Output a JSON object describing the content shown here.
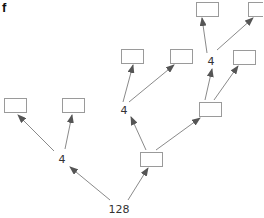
{
  "panel_label": "f",
  "colors": {
    "box_stroke": "#9a9a9a",
    "edge": "#8a8a8a",
    "arrowhead": "#555555",
    "text": "#333333"
  },
  "nodes": [
    {
      "id": "root",
      "type": "label",
      "text": "128",
      "x": 119,
      "y": 213
    },
    {
      "id": "n4a",
      "type": "label",
      "text": "4",
      "x": 62,
      "y": 163
    },
    {
      "id": "n4b",
      "type": "label",
      "text": "4",
      "x": 124,
      "y": 114
    },
    {
      "id": "n4c",
      "type": "label",
      "text": "4",
      "x": 211,
      "y": 65
    },
    {
      "id": "boxA",
      "type": "box",
      "x": 4,
      "y": 98,
      "w": 22,
      "h": 14
    },
    {
      "id": "boxB",
      "type": "box",
      "x": 62,
      "y": 98,
      "w": 22,
      "h": 14
    },
    {
      "id": "boxC",
      "type": "box",
      "x": 121,
      "y": 49,
      "w": 22,
      "h": 14
    },
    {
      "id": "boxD",
      "type": "box",
      "x": 170,
      "y": 49,
      "w": 22,
      "h": 14
    },
    {
      "id": "boxE",
      "type": "box",
      "x": 140,
      "y": 152,
      "w": 22,
      "h": 14
    },
    {
      "id": "boxF",
      "type": "box",
      "x": 199,
      "y": 102,
      "w": 22,
      "h": 14
    },
    {
      "id": "boxG",
      "type": "box",
      "x": 233,
      "y": 50,
      "w": 22,
      "h": 14
    },
    {
      "id": "boxH",
      "type": "box",
      "x": 196,
      "y": 2,
      "w": 22,
      "h": 14
    },
    {
      "id": "boxI",
      "type": "box",
      "x": 248,
      "y": 2,
      "w": 22,
      "h": 14
    }
  ],
  "edges": [
    {
      "from": "root",
      "to": "n4a",
      "x1": 110,
      "y1": 200,
      "x2": 70,
      "y2": 167
    },
    {
      "from": "root",
      "to": "boxE",
      "x1": 128,
      "y1": 200,
      "x2": 148,
      "y2": 168
    },
    {
      "from": "n4a",
      "to": "boxA",
      "x1": 54,
      "y1": 151,
      "x2": 18,
      "y2": 115
    },
    {
      "from": "n4a",
      "to": "boxB",
      "x1": 65,
      "y1": 149,
      "x2": 72,
      "y2": 115
    },
    {
      "from": "boxE",
      "to": "n4b",
      "x1": 146,
      "y1": 150,
      "x2": 131,
      "y2": 117
    },
    {
      "from": "boxE",
      "to": "boxF",
      "x1": 156,
      "y1": 150,
      "x2": 200,
      "y2": 118
    },
    {
      "from": "n4b",
      "to": "boxC",
      "x1": 123,
      "y1": 102,
      "x2": 133,
      "y2": 65
    },
    {
      "from": "n4b",
      "to": "boxD",
      "x1": 129,
      "y1": 102,
      "x2": 174,
      "y2": 65
    },
    {
      "from": "boxF",
      "to": "n4c",
      "x1": 205,
      "y1": 100,
      "x2": 212,
      "y2": 69
    },
    {
      "from": "boxF",
      "to": "boxG",
      "x1": 214,
      "y1": 100,
      "x2": 238,
      "y2": 66
    },
    {
      "from": "n4c",
      "to": "boxH",
      "x1": 207,
      "y1": 53,
      "x2": 202,
      "y2": 18
    },
    {
      "from": "n4c",
      "to": "boxI",
      "x1": 217,
      "y1": 50,
      "x2": 253,
      "y2": 18
    }
  ]
}
